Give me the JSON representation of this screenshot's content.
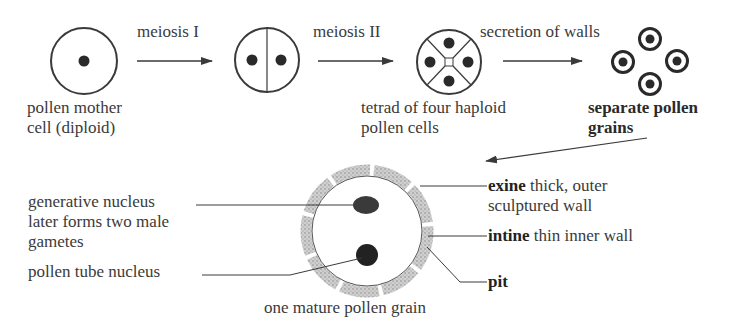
{
  "stages": {
    "mother_cell": {
      "line1": "pollen mother",
      "line2": "cell (diploid)"
    },
    "tetrad": {
      "line1": "tetrad of four haploid",
      "line2": "pollen cells"
    },
    "separate": {
      "line1": "separate pollen",
      "line2": "grains"
    }
  },
  "arrows": {
    "meiosis1": "meiosis I",
    "meiosis2": "meiosis II",
    "secretion": "secretion of walls"
  },
  "mature_grain": {
    "caption": "one mature pollen grain",
    "generative": {
      "line1": "generative nucleus",
      "line2": "later forms two male",
      "line3": "gametes"
    },
    "tube_nucleus": "pollen tube nucleus",
    "exine": {
      "term": "exine",
      "rest": " thick, outer",
      "line2": "sculptured wall"
    },
    "intine": {
      "term": "intine",
      "rest": " thin inner wall"
    },
    "pit": "pit"
  },
  "colors": {
    "ink": "#3a3a3a",
    "nucleus": "#2a2a2a",
    "wall": "#bdbdbd"
  }
}
